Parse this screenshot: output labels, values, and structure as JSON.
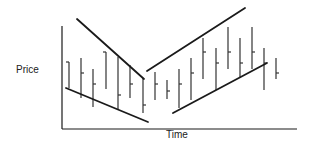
{
  "chart_data": {
    "type": "ohlc-bar",
    "title": "",
    "xlabel": "Time",
    "ylabel": "Price",
    "grid": false,
    "legend": null,
    "note": "Pixel coordinates (y increases downward). Each bar: vertical high-low line with a single horizontal tick (left tick = open, right tick = close).",
    "axes": {
      "y_axis": {
        "x": 62,
        "y1": 26,
        "y2": 129
      },
      "x_axis": {
        "y": 129,
        "x1": 62,
        "x2": 297
      }
    },
    "bars": [
      {
        "x": 69,
        "high": 62,
        "low": 88,
        "tick": 62,
        "side": "left"
      },
      {
        "x": 81,
        "high": 58,
        "low": 98,
        "tick": 73,
        "side": "right"
      },
      {
        "x": 93,
        "high": 69,
        "low": 107,
        "tick": 84,
        "side": "right"
      },
      {
        "x": 106,
        "high": 52,
        "low": 89,
        "tick": 52,
        "side": "left"
      },
      {
        "x": 118,
        "high": 57,
        "low": 109,
        "tick": 95,
        "side": "right"
      },
      {
        "x": 130,
        "high": 65,
        "low": 98,
        "tick": 84,
        "side": "right"
      },
      {
        "x": 143,
        "high": 78,
        "low": 113,
        "tick": 105,
        "side": "right"
      },
      {
        "x": 155,
        "high": 72,
        "low": 100,
        "tick": 84,
        "side": "right"
      },
      {
        "x": 167,
        "high": 80,
        "low": 99,
        "tick": 91,
        "side": "right"
      },
      {
        "x": 179,
        "high": 69,
        "low": 108,
        "tick": 84,
        "side": "right"
      },
      {
        "x": 191,
        "high": 58,
        "low": 100,
        "tick": 73,
        "side": "right"
      },
      {
        "x": 203,
        "high": 38,
        "low": 79,
        "tick": 52,
        "side": "right"
      },
      {
        "x": 216,
        "high": 48,
        "low": 90,
        "tick": 63,
        "side": "right"
      },
      {
        "x": 228,
        "high": 27,
        "low": 69,
        "tick": 52,
        "side": "right"
      },
      {
        "x": 240,
        "high": 38,
        "low": 78,
        "tick": 63,
        "side": "right"
      },
      {
        "x": 252,
        "high": 27,
        "low": 69,
        "tick": 52,
        "side": "right"
      },
      {
        "x": 264,
        "high": 48,
        "low": 90,
        "tick": 63,
        "side": "right"
      },
      {
        "x": 276,
        "high": 58,
        "low": 79,
        "tick": 73,
        "side": "right"
      }
    ],
    "trendlines": [
      {
        "name": "downtrend-resistance",
        "x1": 77,
        "y1": 19,
        "x2": 144,
        "y2": 79
      },
      {
        "name": "downtrend-support",
        "x1": 66,
        "y1": 88,
        "x2": 148,
        "y2": 122
      },
      {
        "name": "uptrend-resistance",
        "x1": 147,
        "y1": 71,
        "x2": 245,
        "y2": 8
      },
      {
        "name": "uptrend-support",
        "x1": 173,
        "y1": 113,
        "x2": 267,
        "y2": 63
      }
    ],
    "colors": {
      "line": "#1a1a1a",
      "bar": "#333333",
      "background": "#ffffff"
    }
  }
}
